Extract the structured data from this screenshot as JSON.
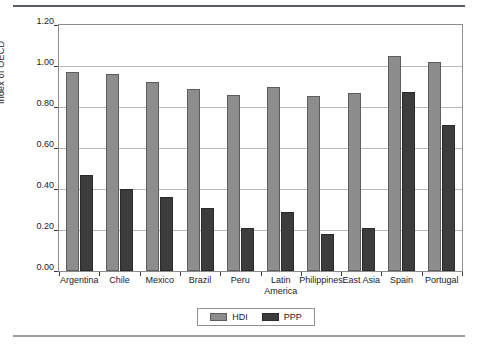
{
  "chart_data": {
    "type": "bar",
    "title": "",
    "xlabel": "",
    "ylabel": "Index of OECD",
    "ylim": [
      0.0,
      1.2
    ],
    "ytick_step": 0.2,
    "ytick_labels": [
      "1.20",
      "1.00",
      "0.80",
      "0.60",
      "0.40",
      "0.20",
      "0.00"
    ],
    "ytick_values": [
      1.2,
      1.0,
      0.8,
      0.6,
      0.4,
      0.2,
      0.0
    ],
    "grid": true,
    "legend_position": "bottom-center",
    "categories": [
      "Argentina",
      "Chile",
      "Mexico",
      "Brazil",
      "Peru",
      "Latin\nAmerica",
      "Philippines",
      "East Asia",
      "Spain",
      "Portugal"
    ],
    "series": [
      {
        "name": "HDI",
        "color": "#8d8d8d",
        "values": [
          0.97,
          0.96,
          0.92,
          0.89,
          0.86,
          0.9,
          0.855,
          0.87,
          1.05,
          1.02
        ]
      },
      {
        "name": "PPP",
        "color": "#3c3c3c",
        "values": [
          0.47,
          0.4,
          0.36,
          0.305,
          0.21,
          0.29,
          0.18,
          0.21,
          0.875,
          0.71
        ]
      }
    ]
  },
  "legend": {
    "items": [
      {
        "label": "HDI",
        "color": "#8d8d8d"
      },
      {
        "label": "PPP",
        "color": "#3c3c3c"
      }
    ]
  },
  "axes": {
    "y_title": "Index of OECD"
  }
}
